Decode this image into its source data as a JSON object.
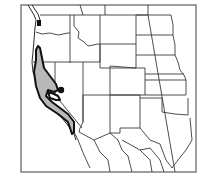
{
  "map": {
    "type": "species-range-map",
    "region": "Western United States",
    "colors": {
      "background": "#ffffff",
      "frame": "#6a6a6a",
      "state_borders": "#3a3a3a",
      "range_fill": "#b8b8b8",
      "range_outline": "#111111"
    },
    "features": {
      "range_area": "Coastal and central California range (shaded)",
      "isolated_occurrence": "Small dark spot near Lake Tahoe area",
      "northern_occurrence": "Dark patch near Puget Sound"
    },
    "labels": []
  }
}
